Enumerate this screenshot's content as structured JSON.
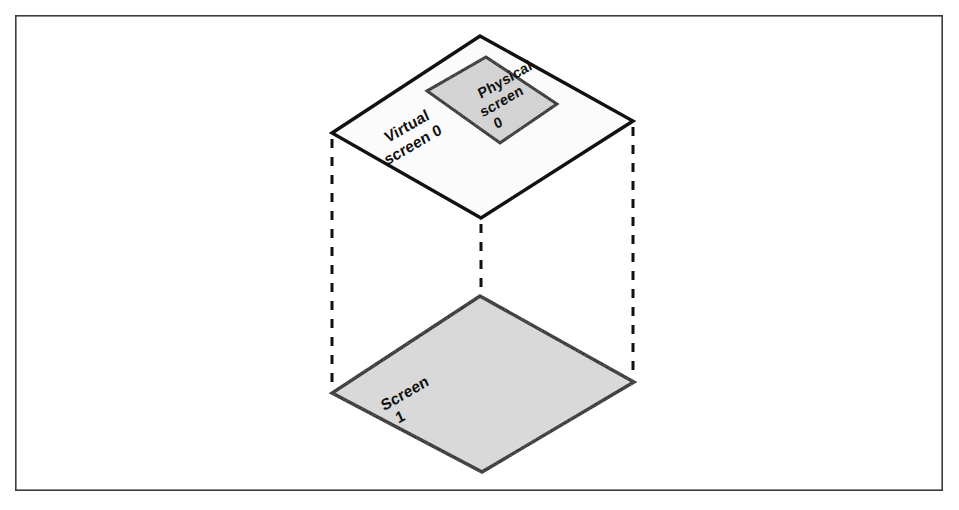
{
  "figure": {
    "background_color": "#ffffff",
    "frame": {
      "name": "figure-border",
      "x": 15,
      "y": 15,
      "width": 928,
      "height": 476,
      "stroke_color": "#3b3b44",
      "stroke_width": 1.6,
      "fill_color": "#ffffff"
    },
    "stroke_color": "#111111",
    "shapes": {
      "virtual_screen": {
        "label_lines": [
          "Virtual",
          "screen 0"
        ],
        "fill_color": "#fbfbfb",
        "stroke_color": "#111111",
        "stroke_width": 3.4,
        "points": "480,36 633,121 481,218 332,133"
      },
      "physical_screen": {
        "label_lines": [
          "Physical",
          "screen",
          "0"
        ],
        "fill_color": "#d6d6d6",
        "stroke_color": "#111111",
        "stroke_width": 3.0,
        "points": "486,57 557,104 500,143 427,91"
      },
      "screen_one": {
        "label_lines": [
          "Screen",
          "1"
        ],
        "fill_color": "#dcdcdc",
        "stroke_color": "#111111",
        "stroke_width": 3.4,
        "points": "480,296 634,382 482,472 332,393"
      }
    },
    "connectors": [
      {
        "name": "left-edge-connector",
        "x1": 332,
        "y1": 139,
        "x2": 332,
        "y2": 388,
        "style": "dashed",
        "stroke_color": "#111111",
        "stroke_width": 3.0
      },
      {
        "name": "center-edge-connector",
        "x1": 481,
        "y1": 224,
        "x2": 481,
        "y2": 470,
        "style": "dashed",
        "stroke_color": "#111111",
        "stroke_width": 3.0
      },
      {
        "name": "right-edge-connector",
        "x1": 633,
        "y1": 127,
        "x2": 633,
        "y2": 377,
        "style": "dashed",
        "stroke_color": "#111111",
        "stroke_width": 3.0
      }
    ]
  }
}
